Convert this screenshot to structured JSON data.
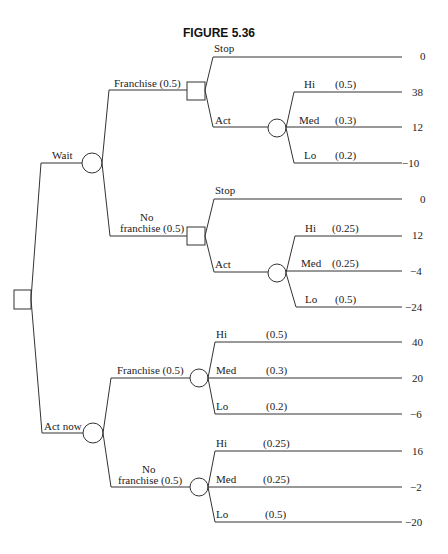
{
  "title": "FIGURE 5.36",
  "root": {
    "type": "decision"
  },
  "labels": {
    "wait": "Wait",
    "act_now": "Act now",
    "franchise": "Franchise (0.5)",
    "no": "No",
    "no_franchise": "franchise (0.5)",
    "stop": "Stop",
    "act": "Act",
    "hi": "Hi",
    "med": "Med",
    "lo": "Lo"
  },
  "probs": {
    "w_f_hi": "(0.5)",
    "w_f_med": "(0.3)",
    "w_f_lo": "(0.2)",
    "w_nf_hi": "(0.25)",
    "w_nf_med": "(0.25)",
    "w_nf_lo": "(0.5)",
    "a_f_hi": "(0.5)",
    "a_f_med": "(0.3)",
    "a_f_lo": "(0.2)",
    "a_nf_hi": "(0.25)",
    "a_nf_med": "(0.25)",
    "a_nf_lo": "(0.5)"
  },
  "payoffs": {
    "w_f_stop": "0",
    "w_f_hi": "38",
    "w_f_med": "12",
    "w_f_lo": "−10",
    "w_nf_stop": "0",
    "w_nf_hi": "12",
    "w_nf_med": "−4",
    "w_nf_lo": "−24",
    "a_f_hi": "40",
    "a_f_med": "20",
    "a_f_lo": "−6",
    "a_nf_hi": "16",
    "a_nf_med": "−2",
    "a_nf_lo": "−20"
  }
}
